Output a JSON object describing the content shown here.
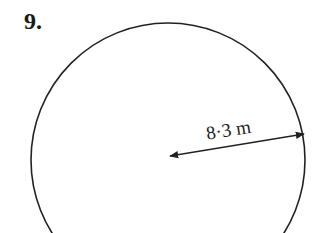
{
  "question": {
    "number": "9."
  },
  "figure": {
    "shape": "circle",
    "radius_label": "8·3 m",
    "colors": {
      "stroke": "#222222",
      "background": "#ffffff"
    }
  }
}
